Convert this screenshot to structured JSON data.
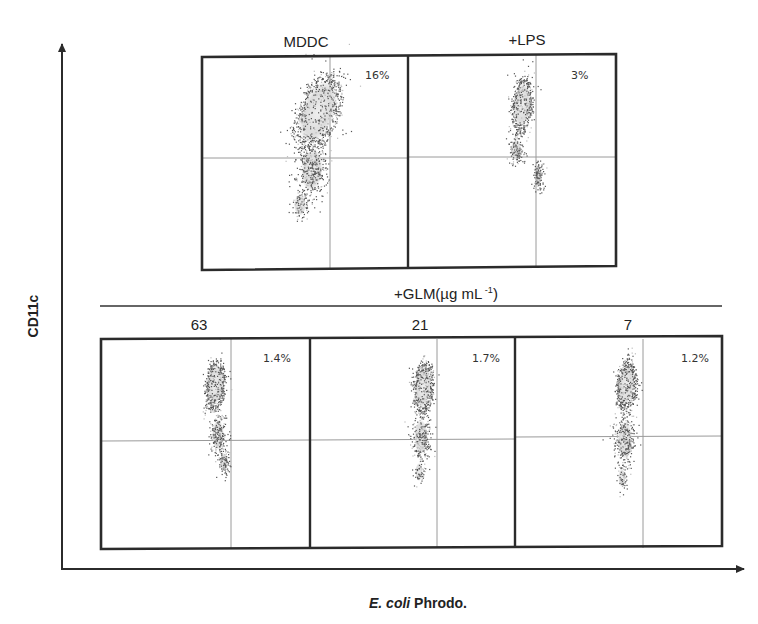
{
  "figure": {
    "y_axis_label": "CD11c",
    "x_axis_label_italic": "E. coli",
    "x_axis_label_rest": " Phrodo.",
    "group_label": "+GLM(µg mL",
    "group_label_sup": " -1",
    "group_label_close": ")",
    "colors": {
      "frame": "#2b2b2b",
      "quadrant": "#9a9a9a",
      "dots_dark": "#555555",
      "dots_light": "#bdbdbd",
      "core": "#e2e2e2"
    }
  },
  "panels": [
    {
      "id": "mddc",
      "title": "MDDC",
      "percent": "16%",
      "row": 0
    },
    {
      "id": "lps",
      "title": "+LPS",
      "percent": "3%",
      "row": 0
    },
    {
      "id": "glm63",
      "title": "63",
      "percent": "1.4%",
      "row": 1
    },
    {
      "id": "glm21",
      "title": "21",
      "percent": "1.7%",
      "row": 1
    },
    {
      "id": "glm7",
      "title": "7",
      "percent": "1.2%",
      "row": 1
    }
  ],
  "chart_data": {
    "type": "scatter",
    "title": "",
    "xlabel": "E. coli Phrodo.",
    "ylabel": "CD11c",
    "panels": [
      {
        "name": "MDDC",
        "upper_right_quadrant_percent": 16
      },
      {
        "name": "+LPS",
        "upper_right_quadrant_percent": 3
      },
      {
        "name": "+GLM 63 µg mL-1",
        "upper_right_quadrant_percent": 1.4
      },
      {
        "name": "+GLM 21 µg mL-1",
        "upper_right_quadrant_percent": 1.7
      },
      {
        "name": "+GLM 7 µg mL-1",
        "upper_right_quadrant_percent": 1.2
      }
    ],
    "group_annotation": "+GLM(µg mL-1)",
    "grid": false,
    "legend": "none"
  }
}
